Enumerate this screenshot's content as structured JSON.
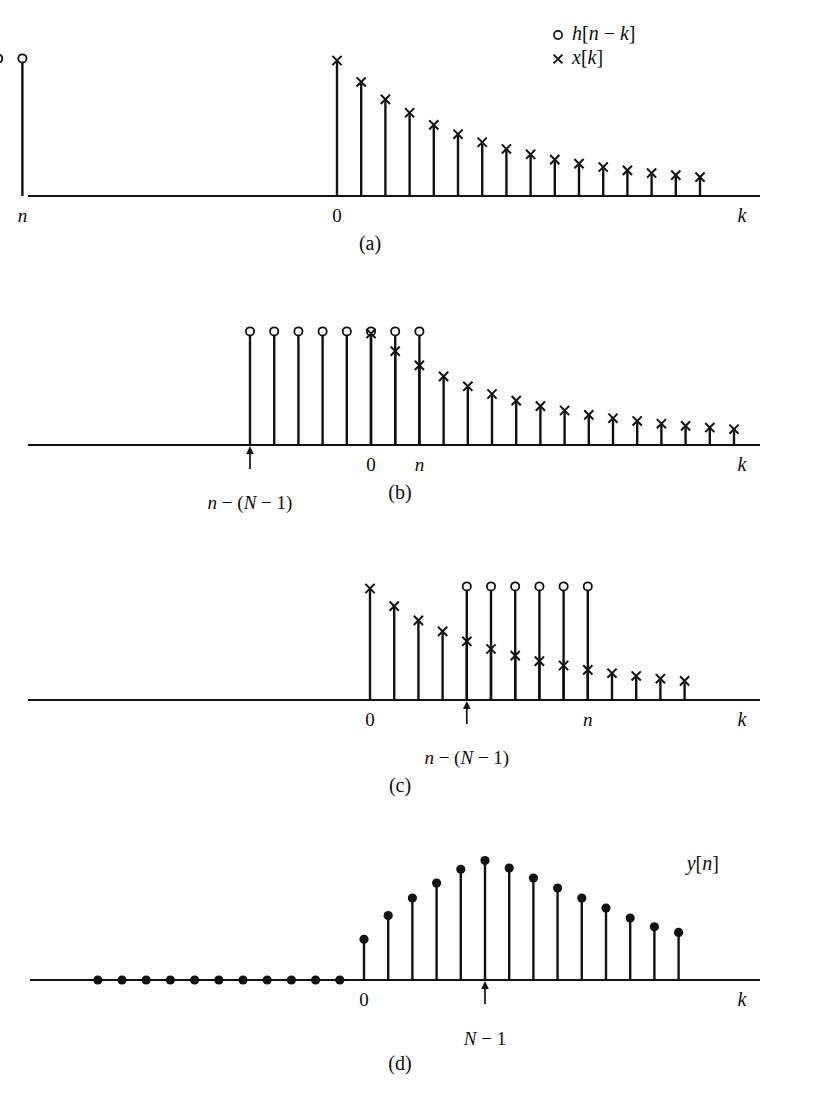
{
  "figure": {
    "axis_label_k": "k",
    "stroke_color": "#111111",
    "background": "#ffffff"
  },
  "legend": {
    "entries": [
      {
        "marker": "circle-marker",
        "symbol": "○",
        "label_h": "h",
        "label_arg": "[n − k]",
        "label": "h[n − k]"
      },
      {
        "marker": "cross-marker",
        "symbol": "×",
        "label_h": "x",
        "label_arg": "[k]",
        "label": "x[k]"
      }
    ]
  },
  "panels": [
    {
      "id": "a",
      "caption": "(a)",
      "axis_labels": [
        {
          "name": "label-n",
          "text": "n",
          "italic": true
        },
        {
          "name": "label-zero",
          "text": "0",
          "italic": false
        },
        {
          "name": "label-k",
          "text": "k",
          "italic": true
        }
      ],
      "arrow_label": "n − (N − 1)",
      "note": "h[n-k] window entirely to the left of k=0; no overlap with x[k]"
    },
    {
      "id": "b",
      "caption": "(b)",
      "axis_labels": [
        {
          "name": "label-zero",
          "text": "0",
          "italic": false
        },
        {
          "name": "label-n",
          "text": "n",
          "italic": true
        },
        {
          "name": "label-k",
          "text": "k",
          "italic": true
        }
      ],
      "arrow_label": "n − (N − 1)",
      "note": "window partially overlapping the onset of x[k]"
    },
    {
      "id": "c",
      "caption": "(c)",
      "axis_labels": [
        {
          "name": "label-zero",
          "text": "0",
          "italic": false
        },
        {
          "name": "label-n",
          "text": "n",
          "italic": true
        },
        {
          "name": "label-k",
          "text": "k",
          "italic": true
        }
      ],
      "arrow_label": "n − (N − 1)",
      "note": "window fully inside the support of x[k]"
    },
    {
      "id": "d",
      "caption": "(d)",
      "axis_labels": [
        {
          "name": "label-zero",
          "text": "0",
          "italic": false
        },
        {
          "name": "label-k",
          "text": "k",
          "italic": true
        }
      ],
      "arrow_label": "N − 1",
      "output_label": "y[n]",
      "note": "resulting output sequence y[n]"
    }
  ],
  "chart_data": [
    {
      "id": "a",
      "type": "stem",
      "title": "(a)",
      "xlabel": "k",
      "ylabel": "",
      "xlim": [
        -22,
        26
      ],
      "ylim": [
        0,
        1.05
      ],
      "grid": false,
      "legend_position": "top-right",
      "annotations": [
        {
          "text": "n − (N − 1)",
          "x": -18,
          "y": 0,
          "type": "arrow-up"
        },
        {
          "text": "n",
          "x": -13,
          "y": 0,
          "type": "tick-label"
        },
        {
          "text": "0",
          "x": 0,
          "y": 0,
          "type": "tick-label"
        }
      ],
      "series": [
        {
          "name": "h[n − k]",
          "marker": "circle",
          "x": [
            -18,
            -17,
            -16,
            -15,
            -14,
            -13
          ],
          "values": [
            1.0,
            1.0,
            1.0,
            1.0,
            1.0,
            1.0
          ]
        },
        {
          "name": "x[k]",
          "marker": "cross",
          "x": [
            0,
            1,
            2,
            3,
            4,
            5,
            6,
            7,
            8,
            9,
            10,
            11,
            12,
            13,
            14,
            15
          ],
          "values": [
            1.0,
            0.84,
            0.71,
            0.61,
            0.52,
            0.45,
            0.39,
            0.34,
            0.3,
            0.26,
            0.23,
            0.205,
            0.18,
            0.16,
            0.145,
            0.13
          ]
        }
      ]
    },
    {
      "id": "b",
      "type": "stem",
      "title": "(b)",
      "xlabel": "k",
      "ylabel": "",
      "xlim": [
        -22,
        26
      ],
      "ylim": [
        0,
        1.05
      ],
      "grid": false,
      "legend_position": "none",
      "annotations": [
        {
          "text": "n − (N − 1)",
          "x": -5,
          "y": 0,
          "type": "arrow-up"
        },
        {
          "text": "0",
          "x": 0,
          "y": 0,
          "type": "tick-label"
        },
        {
          "text": "n",
          "x": 2,
          "y": 0,
          "type": "tick-label"
        }
      ],
      "series": [
        {
          "name": "h[n − k]",
          "marker": "circle",
          "x": [
            -5,
            -4,
            -3,
            -2,
            -1,
            0,
            1,
            2
          ],
          "values": [
            1.0,
            1.0,
            1.0,
            1.0,
            1.0,
            1.0,
            1.0,
            1.0
          ]
        },
        {
          "name": "x[k]",
          "marker": "cross",
          "x": [
            0,
            1,
            2,
            3,
            4,
            5,
            6,
            7,
            8,
            9,
            10,
            11,
            12,
            13,
            14,
            15
          ],
          "values": [
            1.0,
            0.84,
            0.71,
            0.61,
            0.52,
            0.45,
            0.39,
            0.34,
            0.3,
            0.26,
            0.23,
            0.205,
            0.18,
            0.16,
            0.145,
            0.13
          ]
        }
      ]
    },
    {
      "id": "c",
      "type": "stem",
      "title": "(c)",
      "xlabel": "k",
      "ylabel": "",
      "xlim": [
        -22,
        26
      ],
      "ylim": [
        0,
        1.05
      ],
      "grid": false,
      "legend_position": "none",
      "annotations": [
        {
          "text": "0",
          "x": 0,
          "y": 0,
          "type": "tick-label"
        },
        {
          "text": "n − (N − 1)",
          "x": 4,
          "y": 0,
          "type": "arrow-up"
        },
        {
          "text": "n",
          "x": 9,
          "y": 0,
          "type": "tick-label"
        }
      ],
      "series": [
        {
          "name": "h[n − k]",
          "marker": "circle",
          "x": [
            4,
            5,
            6,
            7,
            8,
            9
          ],
          "values": [
            1.0,
            1.0,
            1.0,
            1.0,
            1.0,
            1.0
          ]
        },
        {
          "name": "x[k]",
          "marker": "cross",
          "x": [
            0,
            1,
            2,
            3,
            4,
            5,
            6,
            7,
            8,
            9,
            10,
            11,
            12,
            13
          ],
          "values": [
            1.0,
            0.84,
            0.71,
            0.61,
            0.52,
            0.45,
            0.39,
            0.34,
            0.3,
            0.26,
            0.23,
            0.205,
            0.18,
            0.16
          ]
        }
      ]
    },
    {
      "id": "d",
      "type": "stem",
      "title": "(d)",
      "xlabel": "k",
      "ylabel": "",
      "xlim": [
        -22,
        26
      ],
      "ylim": [
        0,
        1.05
      ],
      "grid": false,
      "legend_position": "none",
      "annotations": [
        {
          "text": "0",
          "x": 0,
          "y": 0,
          "type": "tick-label"
        },
        {
          "text": "N − 1",
          "x": 5,
          "y": 0,
          "type": "arrow-up"
        },
        {
          "text": "y[n]",
          "x": 14,
          "y": 0.88,
          "type": "series-label"
        }
      ],
      "series": [
        {
          "name": "y[n]",
          "marker": "dot",
          "x": [
            -11,
            -10,
            -9,
            -8,
            -7,
            -6,
            -5,
            -4,
            -3,
            -2,
            -1,
            0,
            1,
            2,
            3,
            4,
            5,
            6,
            7,
            8,
            9,
            10,
            11,
            12,
            13
          ],
          "values": [
            0,
            0,
            0,
            0,
            0,
            0,
            0,
            0,
            0,
            0,
            0,
            0.3,
            0.49,
            0.63,
            0.75,
            0.86,
            0.93,
            0.87,
            0.79,
            0.71,
            0.63,
            0.55,
            0.47,
            0.4,
            0.355
          ]
        }
      ]
    }
  ]
}
